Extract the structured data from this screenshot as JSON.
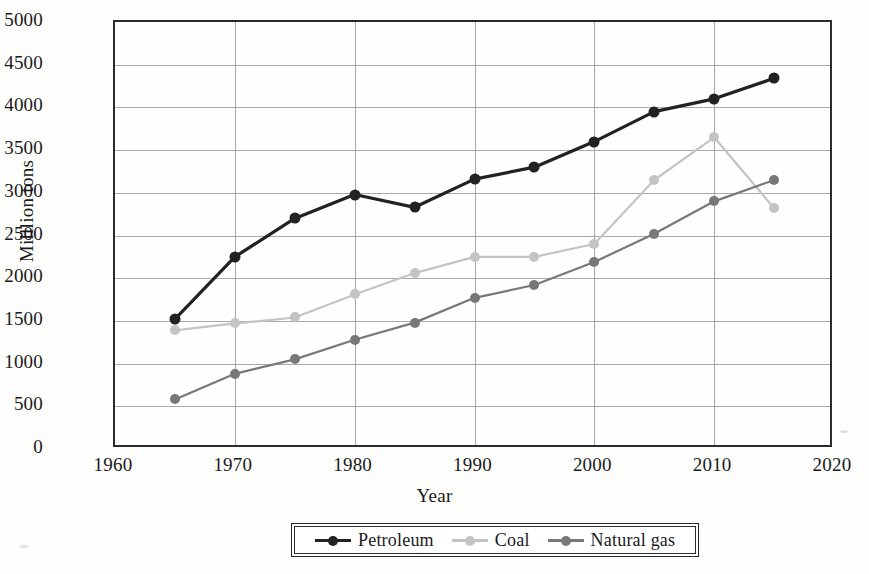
{
  "chart_data": {
    "type": "line",
    "title": "",
    "xlabel": "Year",
    "ylabel": "Milllion tons",
    "x": [
      1965,
      1970,
      1975,
      1980,
      1985,
      1990,
      1995,
      2000,
      2005,
      2010,
      2015
    ],
    "xlim": [
      1960,
      2020
    ],
    "ylim": [
      0,
      5000
    ],
    "xticks": [
      "1960",
      "1970",
      "1980",
      "1990",
      "2000",
      "2010",
      "2020"
    ],
    "xtick_values": [
      1960,
      1970,
      1980,
      1990,
      2000,
      2010,
      2020
    ],
    "yticks": [
      "0",
      "500",
      "1000",
      "1500",
      "2000",
      "2500",
      "3000",
      "3500",
      "4000",
      "4500",
      "5000"
    ],
    "ytick_values": [
      0,
      500,
      1000,
      1500,
      2000,
      2500,
      3000,
      3500,
      4000,
      4500,
      5000
    ],
    "grid": true,
    "legend_position": "bottom",
    "series": [
      {
        "name": "Petroleum",
        "color": "#222222",
        "values": [
          1520,
          2250,
          2700,
          2980,
          2830,
          3160,
          3300,
          3600,
          3950,
          4100,
          4340
        ]
      },
      {
        "name": "Coal",
        "color": "#c4c4c4",
        "values": [
          1390,
          1470,
          1540,
          1810,
          2060,
          2250,
          2250,
          2400,
          3150,
          3650,
          2820
        ]
      },
      {
        "name": "Natural gas",
        "color": "#787878",
        "values": [
          580,
          880,
          1050,
          1280,
          1480,
          1770,
          1920,
          2190,
          2520,
          2900,
          3150
        ]
      }
    ]
  },
  "axis": {
    "y_title": "Milllion tons",
    "x_title": "Year"
  },
  "legend": {
    "entries": [
      {
        "label": "Petroleum",
        "color": "#222222"
      },
      {
        "label": "Coal",
        "color": "#c4c4c4"
      },
      {
        "label": "Natural gas",
        "color": "#787878"
      }
    ]
  }
}
